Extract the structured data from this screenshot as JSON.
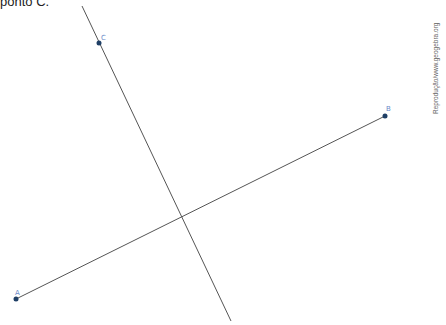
{
  "caption": "ponto C.",
  "credit": "Reprodução/www.geogebra.org",
  "colors": {
    "line": "#555555",
    "point": "#1f3f66",
    "label": "#6a8ac8"
  },
  "points": [
    {
      "name": "A",
      "x": 16,
      "y": 299
    },
    {
      "name": "B",
      "x": 385,
      "y": 116
    },
    {
      "name": "C",
      "x": 99,
      "y": 43
    }
  ],
  "lines": [
    {
      "name": "line-AB",
      "x1": 16,
      "y1": 299,
      "x2": 385,
      "y2": 116
    },
    {
      "name": "line-through-C",
      "x1": 82,
      "y1": 6,
      "x2": 231,
      "y2": 321
    }
  ],
  "intersection": {
    "x": 181,
    "y": 218
  }
}
